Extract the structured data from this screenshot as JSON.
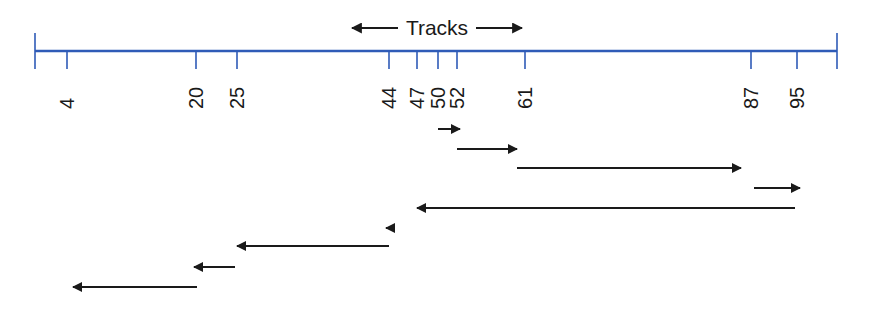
{
  "title": "Tracks",
  "colors": {
    "axis": "#2f5bb7",
    "arrow": "#1a1a1a",
    "background": "#ffffff"
  },
  "axis": {
    "y": 51,
    "x_start": 35,
    "x_end": 837,
    "ticks": [
      {
        "label": "4",
        "value": 4,
        "x": 67
      },
      {
        "label": "20",
        "value": 20,
        "x": 196
      },
      {
        "label": "25",
        "value": 25,
        "x": 237
      },
      {
        "label": "44",
        "value": 44,
        "x": 389
      },
      {
        "label": "47",
        "value": 47,
        "x": 417
      },
      {
        "label": "50",
        "value": 50,
        "x": 438
      },
      {
        "label": "52",
        "value": 52,
        "x": 457
      },
      {
        "label": "61",
        "value": 61,
        "x": 525
      },
      {
        "label": "87",
        "value": 87,
        "x": 751
      },
      {
        "label": "95",
        "value": 95,
        "x": 797
      }
    ]
  },
  "seek_sequence": [
    {
      "from": 50,
      "to": 52,
      "x1": 438,
      "x2": 460,
      "y": 129
    },
    {
      "from": 52,
      "to": 61,
      "x1": 457,
      "x2": 517,
      "y": 149
    },
    {
      "from": 61,
      "to": 87,
      "x1": 517,
      "x2": 741,
      "y": 168
    },
    {
      "from": 87,
      "to": 95,
      "x1": 754,
      "x2": 800,
      "y": 188
    },
    {
      "from": 95,
      "to": 47,
      "x1": 795,
      "x2": 417,
      "y": 208
    },
    {
      "from": 47,
      "to": 44,
      "x1": 389,
      "x2": 386,
      "y": 228
    },
    {
      "from": 44,
      "to": 25,
      "x1": 389,
      "x2": 237,
      "y": 246
    },
    {
      "from": 25,
      "to": 20,
      "x1": 235,
      "x2": 194,
      "y": 267
    },
    {
      "from": 20,
      "to": 4,
      "x1": 197,
      "x2": 73,
      "y": 287
    }
  ]
}
